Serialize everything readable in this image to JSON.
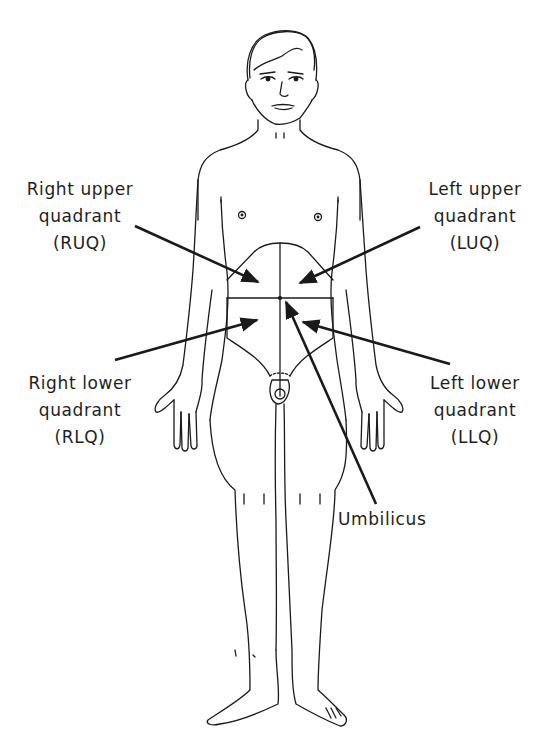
{
  "diagram": {
    "labels": {
      "ruq": {
        "line1": "Right upper",
        "line2": "quadrant",
        "abbr": "(RUQ)"
      },
      "luq": {
        "line1": "Left upper",
        "line2": "quadrant",
        "abbr": "(LUQ)"
      },
      "rlq": {
        "line1": "Right lower",
        "line2": "quadrant",
        "abbr": "(RLQ)"
      },
      "llq": {
        "line1": "Left lower",
        "line2": "quadrant",
        "abbr": "(LLQ)"
      },
      "umbilicus": {
        "text": "Umbilicus"
      }
    },
    "colors": {
      "line": "#1a1a1a",
      "background": "#ffffff"
    }
  }
}
